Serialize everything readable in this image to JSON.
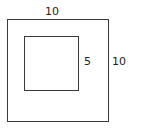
{
  "diagram": {
    "outer_square": {
      "side_label": "10",
      "right_label": "10"
    },
    "inner_square": {
      "side_label": "5"
    }
  }
}
